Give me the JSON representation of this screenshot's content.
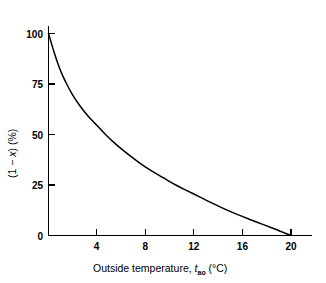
{
  "chart_data": {
    "type": "line",
    "title": "",
    "subtitle": "",
    "xlabel_text": "Outside temperature, ",
    "xlabel_symbol": "t",
    "xlabel_subscript": "ao",
    "xlabel_units": " (°C)",
    "xlabel_full": "Outside temperature, t_ao (°C)",
    "ylabel_full": "(1 − x) (%)",
    "ylabel_part1": "(1 − ",
    "ylabel_symbol": "x",
    "ylabel_part2": ") (%)",
    "xlim": [
      0,
      22.5
    ],
    "ylim": [
      0,
      108
    ],
    "xticks": [
      4,
      8,
      12,
      16,
      20
    ],
    "xtick_labels": [
      "4",
      "8",
      "12",
      "16",
      "20"
    ],
    "yticks": [
      0,
      25,
      50,
      75,
      100
    ],
    "ytick_labels": [
      "0",
      "25",
      "50",
      "75",
      "100"
    ],
    "grid": false,
    "legend": false,
    "legend_position": "none",
    "line_color": "#000000",
    "background_color": "#ffffff",
    "series": [
      {
        "name": "(1 - x) vs outside temperature",
        "x": [
          0,
          0.5,
          1,
          1.5,
          2,
          2.5,
          3,
          3.5,
          4,
          4.7,
          5.5,
          6.5,
          7.5,
          8.5,
          9.5,
          10.5,
          11.5,
          12.5,
          13.5,
          14.5,
          15.5,
          16.5,
          17.5,
          18.5,
          19.25,
          20
        ],
        "values": [
          100,
          90,
          81.5,
          75,
          69.5,
          65,
          61,
          57.5,
          54.5,
          50,
          45.5,
          40.5,
          36,
          32,
          28.5,
          25,
          22,
          19,
          16,
          13.2,
          10.6,
          8.2,
          5.9,
          3.6,
          1.8,
          0
        ]
      }
    ],
    "annotations": []
  }
}
